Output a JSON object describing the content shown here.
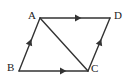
{
  "figure": {
    "type": "geometry-diagram",
    "shape_name": "parallelogram",
    "background_color": "#ffffff",
    "stroke_color": "#333333",
    "label_color": "#222222",
    "width": 132,
    "height": 84,
    "vertices": [
      {
        "id": "A",
        "label": "A",
        "x": 40,
        "y": 18,
        "label_x": 28,
        "label_y": 10
      },
      {
        "id": "D",
        "label": "D",
        "x": 110,
        "y": 18,
        "label_x": 114,
        "label_y": 10
      },
      {
        "id": "B",
        "label": "B",
        "x": 19,
        "y": 71,
        "label_x": 7,
        "label_y": 62
      },
      {
        "id": "C",
        "label": "C",
        "x": 88,
        "y": 71,
        "label_x": 91,
        "label_y": 63
      }
    ],
    "segments": [
      {
        "id": "AD",
        "from": "A",
        "to": "D",
        "arrow": "single",
        "arrow_direction": "right"
      },
      {
        "id": "BC",
        "from": "B",
        "to": "C",
        "arrow": "single",
        "arrow_direction": "right"
      },
      {
        "id": "BA",
        "from": "B",
        "to": "A",
        "arrow": "single",
        "arrow_direction": "up-right"
      },
      {
        "id": "CD",
        "from": "C",
        "to": "D",
        "arrow": "single",
        "arrow_direction": "up-right"
      },
      {
        "id": "AC",
        "from": "A",
        "to": "C",
        "arrow": "none",
        "arrow_direction": ""
      }
    ],
    "arrow_markers": [
      {
        "segment": "AD",
        "x": 75,
        "y": 18,
        "angle": 0
      },
      {
        "segment": "BC",
        "x": 60,
        "y": 71,
        "angle": 0
      },
      {
        "segment": "BA",
        "x": 29,
        "y": 45,
        "angle": -69
      },
      {
        "segment": "CD",
        "x": 99,
        "y": 45,
        "angle": -69
      }
    ]
  }
}
